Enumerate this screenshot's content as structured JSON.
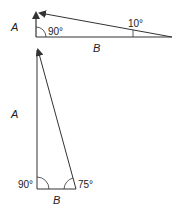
{
  "diagram": {
    "top_triangle": {
      "side_vertical_label": "A",
      "side_horizontal_label": "B",
      "right_angle_label": "90°",
      "acute_angle_label": "10°"
    },
    "bottom_triangle": {
      "side_vertical_label": "A",
      "side_horizontal_label": "B",
      "right_angle_label": "90°",
      "acute_angle_label": "75°"
    },
    "colors": {
      "stroke": "#333333",
      "text": "#222222",
      "background": "#ffffff"
    }
  }
}
